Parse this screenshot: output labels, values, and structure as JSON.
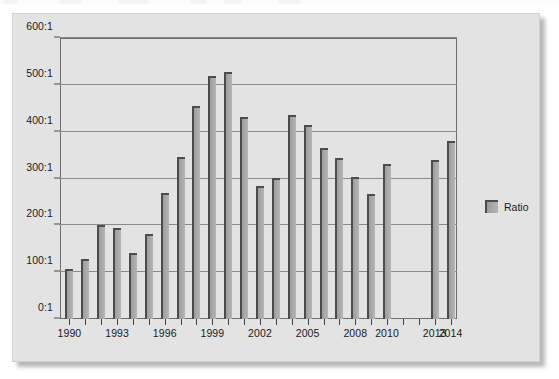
{
  "chart_data": {
    "type": "bar",
    "title": "",
    "subtitle": "",
    "xlabel": "",
    "ylabel": "",
    "ylim": [
      0,
      600
    ],
    "ytick_values": [
      0,
      100,
      200,
      300,
      400,
      500,
      600
    ],
    "ytick_labels": [
      "0:1",
      "100:1",
      "200:1",
      "300:1",
      "400:1",
      "500:1",
      "600:1"
    ],
    "xtick_labels": [
      "1990",
      "1993",
      "1996",
      "1999",
      "2002",
      "2005",
      "2008",
      "2010",
      "2013",
      "2014"
    ],
    "grid": true,
    "legend_position": "right",
    "series": [
      {
        "name": "Ratio",
        "color": "#a8a8a8",
        "categories": [
          "1990",
          "1991",
          "1992",
          "1993",
          "1994",
          "1995",
          "1996",
          "1997",
          "1998",
          "1999",
          "2000",
          "2001",
          "2002",
          "2003",
          "2004",
          "2005",
          "2006",
          "2007",
          "2008",
          "2009",
          "2010",
          "2011",
          "2012",
          "2013",
          "2014"
        ],
        "values": [
          106,
          129,
          201,
          195,
          141,
          181,
          269,
          345,
          455,
          519,
          527,
          431,
          283,
          301,
          436,
          414,
          366,
          343,
          304,
          268,
          330,
          null,
          null,
          340,
          380
        ]
      }
    ]
  },
  "legend": {
    "items": [
      {
        "label": "Ratio",
        "color": "#a8a8a8"
      }
    ]
  }
}
